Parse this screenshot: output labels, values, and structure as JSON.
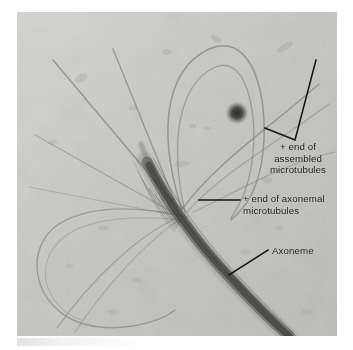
{
  "figure": {
    "kind": "electron-micrograph",
    "plate": {
      "background_color": "#c9c9c6",
      "left": 17,
      "top": 12,
      "width": 320,
      "height": 324
    }
  },
  "annotations": [
    {
      "id": "assembled",
      "text": "+ end of\nassembled\nmicrotubules",
      "color": "#1d1d1d",
      "pointer": "v-shaped-bracket"
    },
    {
      "id": "axonemal",
      "text": "+ end of axonemal\nmicrotubules",
      "color": "#1d1d1d",
      "pointer": "horizontal-leader"
    },
    {
      "id": "axoneme",
      "text": "Axoneme",
      "color": "#1d1d1d",
      "pointer": "diagonal-leader"
    }
  ],
  "features": {
    "dark_particle": {
      "cx": 220,
      "cy": 101,
      "r": 9
    },
    "axoneme_bundle": "thick dark curved bundle running from upper-left to lower-right",
    "nucleation_point": {
      "x": 158,
      "y": 193
    }
  }
}
